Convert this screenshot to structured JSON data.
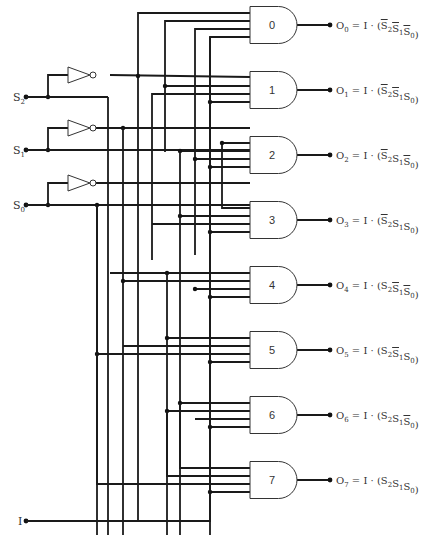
{
  "inputs": [
    {
      "name": "S2",
      "label": "S",
      "sub": "2",
      "y": 97
    },
    {
      "name": "S1",
      "label": "S",
      "sub": "1",
      "y": 150
    },
    {
      "name": "S0",
      "label": "S",
      "sub": "0",
      "y": 205
    },
    {
      "name": "I",
      "label": "I",
      "sub": "",
      "y": 521
    }
  ],
  "inverters": [
    {
      "input": "S2",
      "y": 75
    },
    {
      "input": "S1",
      "y": 128
    },
    {
      "input": "S0",
      "y": 183
    }
  ],
  "gates": [
    {
      "id": "0",
      "y": 25,
      "output": "O",
      "sub": "0",
      "terms": [
        {
          "s": "S",
          "n": "2",
          "bar": true
        },
        {
          "s": "S",
          "n": "1",
          "bar": true
        },
        {
          "s": "S",
          "n": "0",
          "bar": true
        }
      ]
    },
    {
      "id": "1",
      "y": 90,
      "output": "O",
      "sub": "1",
      "terms": [
        {
          "s": "S",
          "n": "2",
          "bar": true
        },
        {
          "s": "S",
          "n": "1",
          "bar": true
        },
        {
          "s": "S",
          "n": "0",
          "bar": false
        }
      ]
    },
    {
      "id": "2",
      "y": 155,
      "output": "O",
      "sub": "2",
      "terms": [
        {
          "s": "S",
          "n": "2",
          "bar": true
        },
        {
          "s": "S",
          "n": "1",
          "bar": false
        },
        {
          "s": "S",
          "n": "0",
          "bar": true
        }
      ]
    },
    {
      "id": "3",
      "y": 220,
      "output": "O",
      "sub": "3",
      "terms": [
        {
          "s": "S",
          "n": "2",
          "bar": true
        },
        {
          "s": "S",
          "n": "1",
          "bar": false
        },
        {
          "s": "S",
          "n": "0",
          "bar": false
        }
      ]
    },
    {
      "id": "4",
      "y": 285,
      "output": "O",
      "sub": "4",
      "terms": [
        {
          "s": "S",
          "n": "2",
          "bar": false
        },
        {
          "s": "S",
          "n": "1",
          "bar": true
        },
        {
          "s": "S",
          "n": "0",
          "bar": true
        }
      ]
    },
    {
      "id": "5",
      "y": 350,
      "output": "O",
      "sub": "5",
      "terms": [
        {
          "s": "S",
          "n": "2",
          "bar": false
        },
        {
          "s": "S",
          "n": "1",
          "bar": true
        },
        {
          "s": "S",
          "n": "0",
          "bar": false
        }
      ]
    },
    {
      "id": "6",
      "y": 415,
      "output": "O",
      "sub": "6",
      "terms": [
        {
          "s": "S",
          "n": "2",
          "bar": false
        },
        {
          "s": "S",
          "n": "1",
          "bar": false
        },
        {
          "s": "S",
          "n": "0",
          "bar": true
        }
      ]
    },
    {
      "id": "7",
      "y": 480,
      "output": "O",
      "sub": "7",
      "terms": [
        {
          "s": "S",
          "n": "2",
          "bar": false
        },
        {
          "s": "S",
          "n": "1",
          "bar": false
        },
        {
          "s": "S",
          "n": "0",
          "bar": false
        }
      ]
    }
  ],
  "equation": {
    "eq": "=",
    "enable": "I",
    "dot": "·"
  },
  "colors": {
    "wire": "#1a1a1a",
    "gate_stroke": "#333333",
    "background": "#ffffff"
  }
}
